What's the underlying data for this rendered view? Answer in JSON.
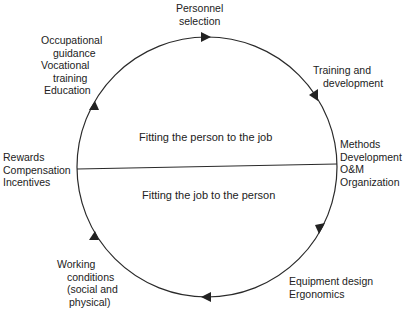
{
  "diagram": {
    "type": "cycle",
    "colors": {
      "line": "#2a2a2a",
      "text": "#222222",
      "background": "#ffffff"
    },
    "upper_half_label": "Fitting the person to the job",
    "lower_half_label": "Fitting the job to the person",
    "nodes": [
      {
        "id": "top",
        "lines": [
          "Personnel",
          "selection"
        ]
      },
      {
        "id": "upper-right",
        "lines": [
          "Training and",
          "development"
        ]
      },
      {
        "id": "right",
        "lines": [
          "Methods",
          "Development",
          "O&M",
          "Organization"
        ]
      },
      {
        "id": "lower-right",
        "lines": [
          "Equipment design",
          "Ergonomics"
        ]
      },
      {
        "id": "lower-left",
        "lines": [
          "Working",
          "conditions",
          "(social and",
          "physical)"
        ]
      },
      {
        "id": "left",
        "lines": [
          "Rewards",
          "Compensation",
          "Incentives"
        ]
      },
      {
        "id": "upper-left",
        "lines": [
          "Occupational",
          "guidance",
          "Vocational",
          "training",
          "Education"
        ]
      }
    ],
    "flow_direction": "clockwise"
  }
}
